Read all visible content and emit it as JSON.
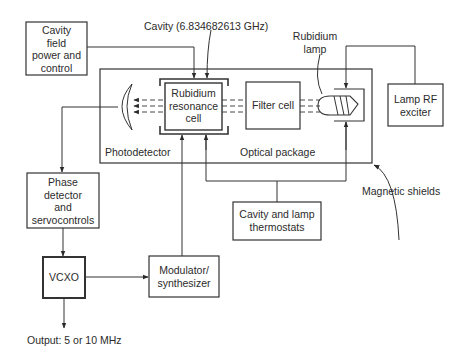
{
  "diagram": {
    "type": "block-diagram",
    "blocks": {
      "cavity_field": {
        "label": "Cavity field power and control",
        "lines": [
          "Cavity",
          "field",
          "power and",
          "control"
        ]
      },
      "rubidium_cell": {
        "lines": [
          "Rubidium",
          "resonance",
          "cell"
        ]
      },
      "filter_cell": {
        "label": "Filter cell"
      },
      "lamp_rf": {
        "lines": [
          "Lamp RF",
          "exciter"
        ]
      },
      "phase_detector": {
        "lines": [
          "Phase",
          "detector",
          "and",
          "servocontrols"
        ]
      },
      "vcxo": {
        "label": "VCXO"
      },
      "modulator": {
        "lines": [
          "Modulator/",
          "synthesizer"
        ]
      },
      "thermostats": {
        "lines": [
          "Cavity and lamp",
          "thermostats"
        ]
      }
    },
    "annotations": {
      "cavity_freq": "Cavity (6.834682613 GHz)",
      "rubidium_lamp": [
        "Rubidium",
        "lamp"
      ],
      "photodetector": "Photodetector",
      "optical_package": "Optical package",
      "magnetic_shields": "Magnetic shields",
      "output": "Output: 5 or 10 MHz"
    },
    "connections": [
      {
        "from": "Cavity field power and control",
        "to": "Rubidium resonance cell"
      },
      {
        "from": "Lamp RF exciter",
        "to": "Rubidium lamp"
      },
      {
        "from": "Photodetector",
        "to": "Phase detector and servocontrols"
      },
      {
        "from": "Phase detector and servocontrols",
        "to": "VCXO"
      },
      {
        "from": "VCXO",
        "to": "Modulator/synthesizer"
      },
      {
        "from": "Modulator/synthesizer",
        "to": "Rubidium resonance cell"
      },
      {
        "from": "Cavity and lamp thermostats",
        "to": "Rubidium resonance cell"
      },
      {
        "from": "Cavity and lamp thermostats",
        "to": "Rubidium lamp"
      },
      {
        "from": "VCXO",
        "to": "Output"
      }
    ],
    "colors": {
      "line": "#333333",
      "background": "#ffffff"
    }
  }
}
